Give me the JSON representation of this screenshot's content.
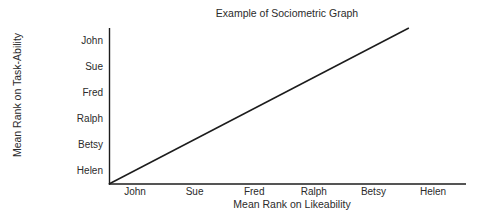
{
  "chart_data": {
    "type": "line",
    "title": "Example of Sociometric Graph",
    "xlabel": "Mean Rank on Likeability",
    "ylabel": "Mean Rank on Task-Ability",
    "x_categories": [
      "John",
      "Sue",
      "Fred",
      "Ralph",
      "Betsy",
      "Helen"
    ],
    "y_categories": [
      "John",
      "Sue",
      "Fred",
      "Ralph",
      "Betsy",
      "Helen"
    ],
    "grid": false,
    "legend": "none",
    "tick_marks": false,
    "series": [
      {
        "name": "rank-agreement-line",
        "description": "straight diagonal from axis origin rising to upper right",
        "points_fraction": [
          [
            0.0,
            0.0
          ],
          [
            0.84,
            1.0
          ]
        ]
      }
    ],
    "colors": {
      "background": "#ffffff",
      "axis_line": "#1c1c1c",
      "series_line": "#1c1c1c",
      "text": "#2b2b2b"
    }
  }
}
